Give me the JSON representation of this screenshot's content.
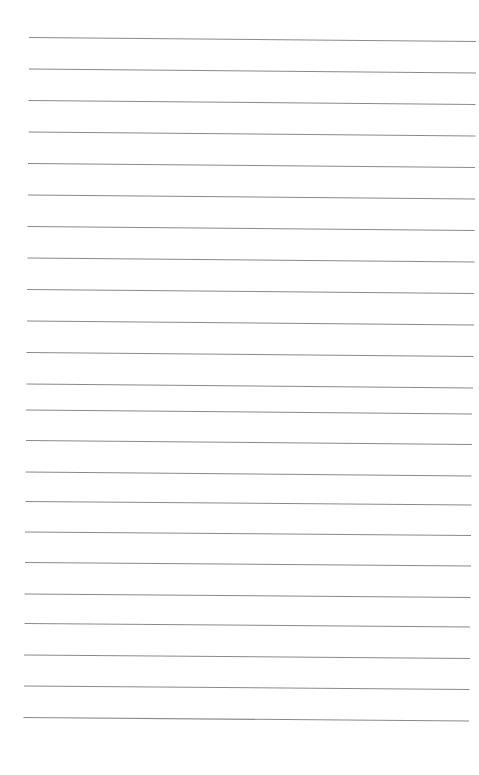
{
  "page": {
    "type": "lined-paper",
    "background": "#ffffff",
    "line_color": "#8a8a8a",
    "line_count": 23,
    "lines": [
      {
        "x1": 29,
        "y1": 37.5,
        "x2": 476,
        "y2": 41.5
      },
      {
        "x1": 29,
        "y1": 69,
        "x2": 476,
        "y2": 73
      },
      {
        "x1": 28.5,
        "y1": 100.5,
        "x2": 475.5,
        "y2": 104.5
      },
      {
        "x1": 28.5,
        "y1": 132,
        "x2": 475.5,
        "y2": 136
      },
      {
        "x1": 28,
        "y1": 163.5,
        "x2": 475,
        "y2": 167.5
      },
      {
        "x1": 28,
        "y1": 195,
        "x2": 475,
        "y2": 199
      },
      {
        "x1": 27.5,
        "y1": 226.5,
        "x2": 474.5,
        "y2": 230.5
      },
      {
        "x1": 27.5,
        "y1": 258,
        "x2": 474.5,
        "y2": 262
      },
      {
        "x1": 27,
        "y1": 289.5,
        "x2": 474,
        "y2": 293.5
      },
      {
        "x1": 27,
        "y1": 321,
        "x2": 474,
        "y2": 325
      },
      {
        "x1": 26.5,
        "y1": 352.5,
        "x2": 473.5,
        "y2": 356.5
      },
      {
        "x1": 26.5,
        "y1": 384,
        "x2": 473,
        "y2": 388
      },
      {
        "x1": 26,
        "y1": 410,
        "x2": 472,
        "y2": 414
      },
      {
        "x1": 26,
        "y1": 440.5,
        "x2": 472,
        "y2": 444.5
      },
      {
        "x1": 25.5,
        "y1": 472,
        "x2": 471.5,
        "y2": 476
      },
      {
        "x1": 25.5,
        "y1": 501.5,
        "x2": 471.5,
        "y2": 505
      },
      {
        "x1": 25,
        "y1": 532,
        "x2": 471,
        "y2": 535.5
      },
      {
        "x1": 25,
        "y1": 562.5,
        "x2": 471,
        "y2": 566
      },
      {
        "x1": 24.5,
        "y1": 594,
        "x2": 470.5,
        "y2": 597.5
      },
      {
        "x1": 24.5,
        "y1": 623.5,
        "x2": 470,
        "y2": 627
      },
      {
        "x1": 24,
        "y1": 655,
        "x2": 470,
        "y2": 658.5
      },
      {
        "x1": 24,
        "y1": 686,
        "x2": 469.5,
        "y2": 689.5
      },
      {
        "x1": 23.5,
        "y1": 717.5,
        "x2": 469,
        "y2": 721
      }
    ]
  }
}
